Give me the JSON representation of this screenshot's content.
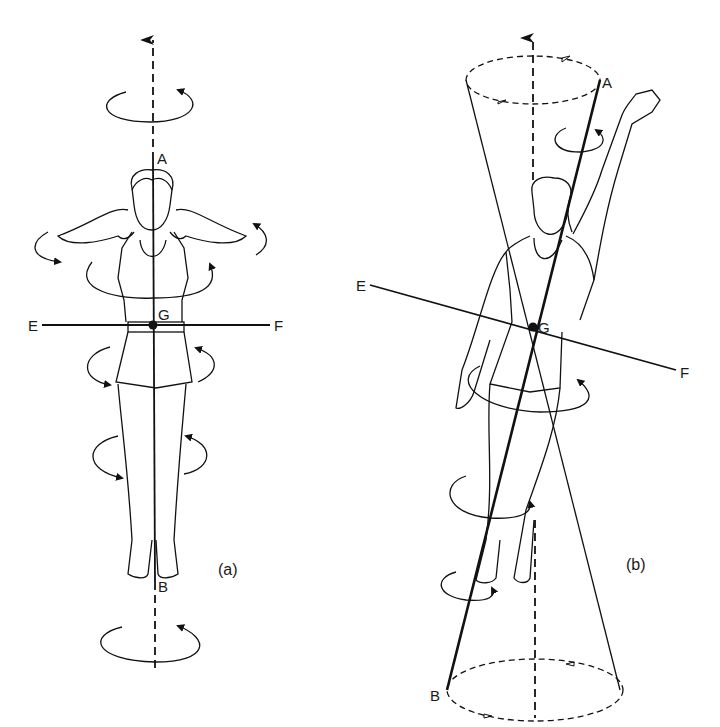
{
  "figure": {
    "panels": [
      {
        "id": "a",
        "caption": "(a)",
        "labels": {
          "top": "A",
          "bottom": "B",
          "center": "G",
          "left": "E",
          "right": "F"
        },
        "axis": "vertical body axis A-B through G, extended as dashed line with arrow upward",
        "transverse_axis": "horizontal axis E-F through G",
        "pose": "standing upright, hands behind head, elbows out"
      },
      {
        "id": "b",
        "caption": "(b)",
        "labels": {
          "top": "A",
          "bottom": "B",
          "center": "G",
          "left": "E",
          "right": "F"
        },
        "axis": "tilted body axis A-B through G sweeping a double cone about the vertical dashed axis",
        "transverse_axis": "tilted axis E-F through G",
        "pose": "one arm raised, body tilted"
      }
    ]
  },
  "colors": {
    "ink": "#111111",
    "background": "#ffffff"
  }
}
